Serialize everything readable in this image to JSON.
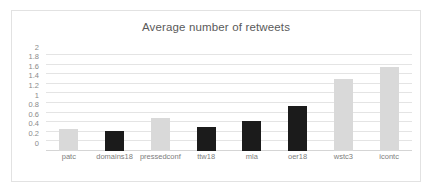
{
  "chart_data": {
    "type": "bar",
    "title": "Average number of retweets",
    "xlabel": "",
    "ylabel": "",
    "ylim": [
      0,
      2
    ],
    "ytick_step": 0.2,
    "yticks": [
      "0",
      "0.2",
      "0.4",
      "0.6",
      "0.8",
      "1",
      "1.2",
      "1.4",
      "1.6",
      "1.8",
      "2"
    ],
    "ytick_values": [
      0,
      0.2,
      0.4,
      0.6,
      0.8,
      1,
      1.2,
      1.4,
      1.6,
      1.8,
      2
    ],
    "grid": true,
    "legend": "none",
    "categories": [
      "patc",
      "domains18",
      "pressedconf",
      "ttw18",
      "mla",
      "oer18",
      "wstc3",
      "icontc"
    ],
    "values": [
      0.46,
      0.42,
      0.69,
      0.49,
      0.62,
      0.93,
      1.51,
      1.74
    ],
    "bar_colors": [
      "#d9d9d9",
      "#1b1b1b",
      "#d9d9d9",
      "#1b1b1b",
      "#1b1b1b",
      "#1b1b1b",
      "#d9d9d9",
      "#d9d9d9"
    ],
    "bars": [
      {
        "label": "patc",
        "value": 0.46,
        "color": "#d9d9d9",
        "shade": "light"
      },
      {
        "label": "domains18",
        "value": 0.42,
        "color": "#1b1b1b",
        "shade": "dark"
      },
      {
        "label": "pressedconf",
        "value": 0.69,
        "color": "#d9d9d9",
        "shade": "light"
      },
      {
        "label": "ttw18",
        "value": 0.49,
        "color": "#1b1b1b",
        "shade": "dark"
      },
      {
        "label": "mla",
        "value": 0.62,
        "color": "#1b1b1b",
        "shade": "dark"
      },
      {
        "label": "oer18",
        "value": 0.93,
        "color": "#1b1b1b",
        "shade": "dark"
      },
      {
        "label": "wstc3",
        "value": 1.51,
        "color": "#d9d9d9",
        "shade": "light"
      },
      {
        "label": "icontc",
        "value": 1.74,
        "color": "#d9d9d9",
        "shade": "light"
      }
    ]
  },
  "style": {
    "plot_background": "#ffffff",
    "border_color": "#e2e2e2",
    "gridline_color": "#e4e4e4",
    "title_color": "#5a5a5a",
    "tick_label_color": "#8a8a8a",
    "category_label_color": "#7d7d7d"
  }
}
